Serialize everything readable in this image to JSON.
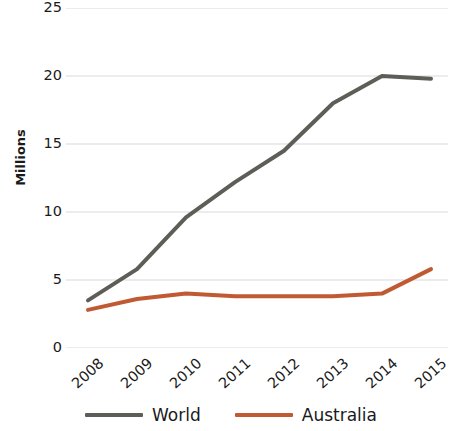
{
  "chart_data": {
    "type": "line",
    "title": "",
    "subtitle": "",
    "xlabel": "",
    "ylabel": "Millions",
    "categories": [
      "2008",
      "2009",
      "2010",
      "2011",
      "2012",
      "2013",
      "2014",
      "2015"
    ],
    "series": [
      {
        "name": "World",
        "color": "#5e5e58",
        "values": [
          3.5,
          5.8,
          9.6,
          12.2,
          14.5,
          18.0,
          20.0,
          19.8
        ]
      },
      {
        "name": "Australia",
        "color": "#c05a33",
        "values": [
          2.8,
          3.6,
          4.0,
          3.8,
          3.8,
          3.8,
          4.0,
          5.8
        ]
      }
    ],
    "ylim": [
      0,
      25
    ],
    "yticks": [
      0,
      5,
      10,
      15,
      20,
      25
    ],
    "ytick_labels": [
      "0",
      "5",
      "10",
      "15",
      "20",
      "25"
    ],
    "grid": true,
    "grid_axis": "y",
    "grid_color": "#d9d9d9",
    "legend_position": "bottom",
    "xtick_rotation": -42,
    "line_width": 4
  },
  "legend": {
    "entries": [
      {
        "label": "World",
        "color": "#5e5e58"
      },
      {
        "label": "Australia",
        "color": "#c05a33"
      }
    ]
  }
}
